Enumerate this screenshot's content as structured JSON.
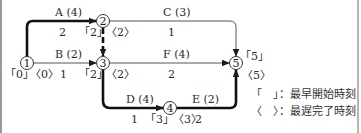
{
  "diagram": {
    "type": "arrow-diagram (PERT network)",
    "nodes": [
      {
        "id": "1",
        "label": "1",
        "earliest_start": "「0」",
        "latest_finish": "〈0〉"
      },
      {
        "id": "2",
        "label": "2",
        "earliest_start": "「2」",
        "latest_finish": "〈2〉"
      },
      {
        "id": "3",
        "label": "3",
        "earliest_start": "「2」",
        "latest_finish": "〈2〉"
      },
      {
        "id": "4",
        "label": "4",
        "earliest_start": "「3」",
        "latest_finish": "〈3〉"
      },
      {
        "id": "5",
        "label": "5",
        "earliest_start": "「5」",
        "latest_finish": "〈5〉"
      }
    ],
    "activities": [
      {
        "name": "A (4)",
        "from": "1",
        "to": "2",
        "value": "2",
        "critical": true
      },
      {
        "name": "B (2)",
        "from": "1",
        "to": "3",
        "value": "1",
        "critical": false
      },
      {
        "name": "C (3)",
        "from": "2",
        "to": "5",
        "value": "1",
        "critical": false
      },
      {
        "name": "F (4)",
        "from": "3",
        "to": "5",
        "value": "2",
        "critical": false
      },
      {
        "name": "D (4)",
        "from": "3",
        "to": "4",
        "value": "1",
        "critical": true
      },
      {
        "name": "E (2)",
        "from": "4",
        "to": "5",
        "value": "2",
        "critical": true
      },
      {
        "name": "dummy",
        "from": "2",
        "to": "3",
        "critical": true
      }
    ],
    "legend": [
      {
        "symbol": "「　」",
        "text": "：最早開始時刻"
      },
      {
        "symbol": "〈　〉",
        "text": "：最遅完了時刻"
      }
    ]
  }
}
